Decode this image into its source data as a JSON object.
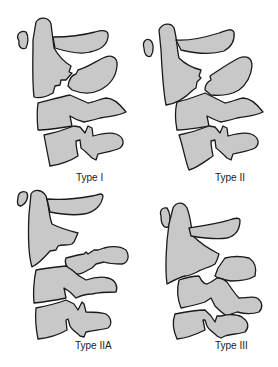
{
  "figure": {
    "fill_color": "#c8c8c8",
    "stroke_color": "#1a1a1a",
    "background": "#ffffff",
    "panels": [
      {
        "id": "type-i",
        "label": "Type I",
        "position": "top-left"
      },
      {
        "id": "type-ii",
        "label": "Type II",
        "position": "top-right"
      },
      {
        "id": "type-iia",
        "label": "Type IIA",
        "position": "bottom-left"
      },
      {
        "id": "type-iii",
        "label": "Type III",
        "position": "bottom-right"
      }
    ]
  }
}
